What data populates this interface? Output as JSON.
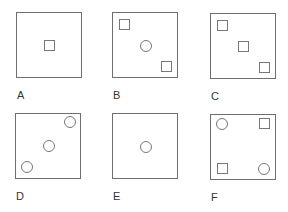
{
  "figure": {
    "panels": [
      {
        "label": "A",
        "shapes": [
          "square-center"
        ]
      },
      {
        "label": "B",
        "shapes": [
          "square-top-left",
          "circle-center",
          "square-bottom-right"
        ]
      },
      {
        "label": "C",
        "shapes": [
          "square-top-left",
          "square-center",
          "square-bottom-right"
        ]
      },
      {
        "label": "D",
        "shapes": [
          "circle-top-right",
          "circle-center",
          "circle-bottom-left"
        ]
      },
      {
        "label": "E",
        "shapes": [
          "circle-center"
        ]
      },
      {
        "label": "F",
        "shapes": [
          "circle-top-left",
          "square-top-right",
          "square-bottom-left",
          "circle-bottom-right"
        ]
      }
    ]
  }
}
